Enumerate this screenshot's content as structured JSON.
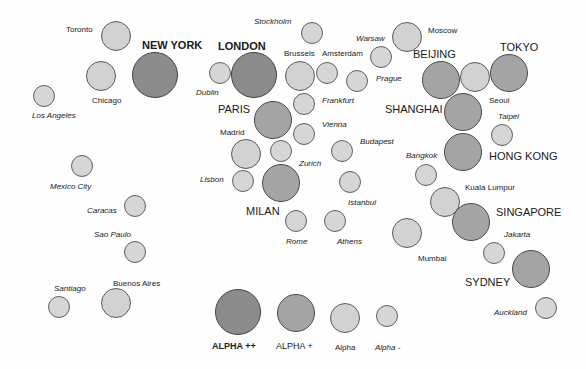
{
  "tiers": {
    "alpha_pp": {
      "label": "ALPHA ++",
      "color": "#8c8c8c"
    },
    "alpha_p": {
      "label": "ALPHA +",
      "color": "#a4a4a4"
    },
    "alpha": {
      "label": "Alpha",
      "color": "#d2d2d2"
    },
    "alpha_m": {
      "label": "Alpha -",
      "color": "#d6d6d6"
    }
  },
  "cities": [
    {
      "name": "Toronto",
      "tier": "a",
      "cx": 116,
      "cy": 36,
      "r": 15,
      "lx": 66,
      "ly": 25,
      "style": "n"
    },
    {
      "name": "NEW YORK",
      "tier": "pp",
      "cx": 155,
      "cy": 75,
      "r": 23,
      "lx": 142,
      "ly": 39,
      "style": "bb"
    },
    {
      "name": "Chicago",
      "tier": "a",
      "cx": 101,
      "cy": 76,
      "r": 15,
      "lx": 92,
      "ly": 96,
      "style": "n"
    },
    {
      "name": "Los Angeles",
      "tier": "m",
      "cx": 44,
      "cy": 96,
      "r": 11,
      "lx": 32,
      "ly": 111,
      "style": "i"
    },
    {
      "name": "Stockholm",
      "tier": "m",
      "cx": 312,
      "cy": 33,
      "r": 11,
      "lx": 254,
      "ly": 17,
      "style": "i"
    },
    {
      "name": "LONDON",
      "tier": "pp",
      "cx": 254,
      "cy": 75,
      "r": 23,
      "lx": 218,
      "ly": 40,
      "style": "bb"
    },
    {
      "name": "Dublin",
      "tier": "m",
      "cx": 220,
      "cy": 73,
      "r": 11,
      "lx": 196,
      "ly": 88,
      "style": "i"
    },
    {
      "name": "Brussels",
      "tier": "a",
      "cx": 300,
      "cy": 76,
      "r": 15,
      "lx": 284,
      "ly": 49,
      "style": "n"
    },
    {
      "name": "Amsterdam",
      "tier": "m",
      "cx": 327,
      "cy": 73,
      "r": 11,
      "lx": 322,
      "ly": 49,
      "style": "n"
    },
    {
      "name": "Warsaw",
      "tier": "m",
      "cx": 381,
      "cy": 57,
      "r": 11,
      "lx": 356,
      "ly": 34,
      "style": "i"
    },
    {
      "name": "Moscow",
      "tier": "a",
      "cx": 407,
      "cy": 37,
      "r": 15,
      "lx": 428,
      "ly": 26,
      "style": "n"
    },
    {
      "name": "Prague",
      "tier": "m",
      "cx": 357,
      "cy": 81,
      "r": 11,
      "lx": 376,
      "ly": 74,
      "style": "i"
    },
    {
      "name": "Frankfurt",
      "tier": "m",
      "cx": 304,
      "cy": 104,
      "r": 11,
      "lx": 322,
      "ly": 96,
      "style": "i"
    },
    {
      "name": "PARIS",
      "tier": "p",
      "cx": 273,
      "cy": 120,
      "r": 19,
      "lx": 218,
      "ly": 103,
      "style": "b"
    },
    {
      "name": "Vienna",
      "tier": "m",
      "cx": 304,
      "cy": 134,
      "r": 11,
      "lx": 322,
      "ly": 120,
      "style": "i"
    },
    {
      "name": "Madrid",
      "tier": "a",
      "cx": 246,
      "cy": 154,
      "r": 15,
      "lx": 220,
      "ly": 128,
      "style": "n"
    },
    {
      "name": "Zurich",
      "tier": "m",
      "cx": 281,
      "cy": 151,
      "r": 11,
      "lx": 299,
      "ly": 159,
      "style": "i"
    },
    {
      "name": "Budapest",
      "tier": "m",
      "cx": 342,
      "cy": 151,
      "r": 11,
      "lx": 360,
      "ly": 137,
      "style": "i"
    },
    {
      "name": "Lisbon",
      "tier": "m",
      "cx": 243,
      "cy": 181,
      "r": 11,
      "lx": 200,
      "ly": 175,
      "style": "i"
    },
    {
      "name": "MILAN",
      "tier": "p",
      "cx": 281,
      "cy": 183,
      "r": 19,
      "lx": 246,
      "ly": 205,
      "style": "b"
    },
    {
      "name": "Istanbul",
      "tier": "m",
      "cx": 350,
      "cy": 182,
      "r": 11,
      "lx": 348,
      "ly": 198,
      "style": "i"
    },
    {
      "name": "Rome",
      "tier": "m",
      "cx": 296,
      "cy": 221,
      "r": 11,
      "lx": 286,
      "ly": 237,
      "style": "i"
    },
    {
      "name": "Athens",
      "tier": "m",
      "cx": 335,
      "cy": 221,
      "r": 11,
      "lx": 337,
      "ly": 237,
      "style": "i"
    },
    {
      "name": "BEIJING",
      "tier": "p",
      "cx": 441,
      "cy": 80,
      "r": 19,
      "lx": 413,
      "ly": 48,
      "style": "b"
    },
    {
      "name": "Seoul",
      "tier": "a",
      "cx": 475,
      "cy": 77,
      "r": 15,
      "lx": 489,
      "ly": 96,
      "style": "n"
    },
    {
      "name": "TOKYO",
      "tier": "p",
      "cx": 509,
      "cy": 73,
      "r": 19,
      "lx": 500,
      "ly": 41,
      "style": "b"
    },
    {
      "name": "SHANGHAI",
      "tier": "p",
      "cx": 463,
      "cy": 112,
      "r": 19,
      "lx": 385,
      "ly": 103,
      "style": "b"
    },
    {
      "name": "Taipei",
      "tier": "m",
      "cx": 502,
      "cy": 135,
      "r": 11,
      "lx": 498,
      "ly": 112,
      "style": "i"
    },
    {
      "name": "HONG KONG",
      "tier": "p",
      "cx": 463,
      "cy": 152,
      "r": 19,
      "lx": 489,
      "ly": 150,
      "style": "b"
    },
    {
      "name": "Bangkok",
      "tier": "m",
      "cx": 426,
      "cy": 175,
      "r": 11,
      "lx": 406,
      "ly": 151,
      "style": "i"
    },
    {
      "name": "Kuala Lumpur",
      "tier": "a",
      "cx": 445,
      "cy": 202,
      "r": 15,
      "lx": 465,
      "ly": 183,
      "style": "n"
    },
    {
      "name": "SINGAPORE",
      "tier": "p",
      "cx": 471,
      "cy": 222,
      "r": 19,
      "lx": 496,
      "ly": 206,
      "style": "b"
    },
    {
      "name": "Mumbai",
      "tier": "a",
      "cx": 407,
      "cy": 233,
      "r": 15,
      "lx": 418,
      "ly": 254,
      "style": "n"
    },
    {
      "name": "Jakarta",
      "tier": "m",
      "cx": 494,
      "cy": 253,
      "r": 11,
      "lx": 504,
      "ly": 230,
      "style": "i"
    },
    {
      "name": "SYDNEY",
      "tier": "p",
      "cx": 531,
      "cy": 269,
      "r": 19,
      "lx": 465,
      "ly": 276,
      "style": "b"
    },
    {
      "name": "Auckland",
      "tier": "m",
      "cx": 546,
      "cy": 308,
      "r": 11,
      "lx": 494,
      "ly": 308,
      "style": "i"
    },
    {
      "name": "Mexico City",
      "tier": "m",
      "cx": 82,
      "cy": 166,
      "r": 11,
      "lx": 50,
      "ly": 182,
      "style": "i"
    },
    {
      "name": "Caracas",
      "tier": "m",
      "cx": 135,
      "cy": 206,
      "r": 11,
      "lx": 87,
      "ly": 206,
      "style": "i"
    },
    {
      "name": "Sao Paulo",
      "tier": "m",
      "cx": 135,
      "cy": 252,
      "r": 11,
      "lx": 94,
      "ly": 230,
      "style": "i"
    },
    {
      "name": "Santiago",
      "tier": "m",
      "cx": 59,
      "cy": 307,
      "r": 11,
      "lx": 54,
      "ly": 284,
      "style": "i"
    },
    {
      "name": "Buenos Aires",
      "tier": "a",
      "cx": 116,
      "cy": 303,
      "r": 15,
      "lx": 113,
      "ly": 279,
      "style": "n"
    }
  ],
  "legend": [
    {
      "label": "ALPHA ++",
      "tier": "pp",
      "cx": 238,
      "cy": 312,
      "r": 23,
      "lx": 212,
      "ly": 341,
      "style": "lb"
    },
    {
      "label": "ALPHA +",
      "tier": "p",
      "cx": 296,
      "cy": 313,
      "r": 19,
      "lx": 276,
      "ly": 341,
      "style": "ln"
    },
    {
      "label": "Alpha",
      "tier": "a",
      "cx": 345,
      "cy": 318,
      "r": 15,
      "lx": 335,
      "ly": 343,
      "style": "n"
    },
    {
      "label": "Alpha -",
      "tier": "m",
      "cx": 387,
      "cy": 316,
      "r": 11,
      "lx": 375,
      "ly": 343,
      "style": "i"
    }
  ]
}
